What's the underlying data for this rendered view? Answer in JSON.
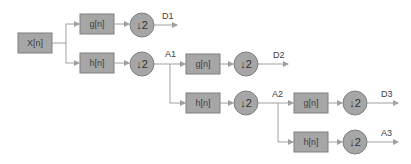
{
  "diagram": {
    "type": "discrete-wavelet-transform-filter-bank",
    "input": {
      "label": "X[n]"
    },
    "levels": [
      {
        "high_filter": "g[n]",
        "low_filter": "h[n]",
        "downsample_high": "↓2",
        "downsample_low": "↓2",
        "detail_output": "D1",
        "approx_output": "A1"
      },
      {
        "high_filter": "g[n]",
        "low_filter": "h[n]",
        "downsample_high": "↓2",
        "downsample_low": "↓2",
        "detail_output": "D2",
        "approx_output": "A2"
      },
      {
        "high_filter": "g[n]",
        "low_filter": "h[n]",
        "downsample_high": "↓2",
        "downsample_low": "↓2",
        "detail_output": "D3",
        "approx_output": "A3"
      }
    ]
  },
  "colors": {
    "block_fill": "#a6a6a6",
    "block_stroke": "#7f7f7f",
    "connector": "#a0a0a0",
    "text": "#404040"
  }
}
